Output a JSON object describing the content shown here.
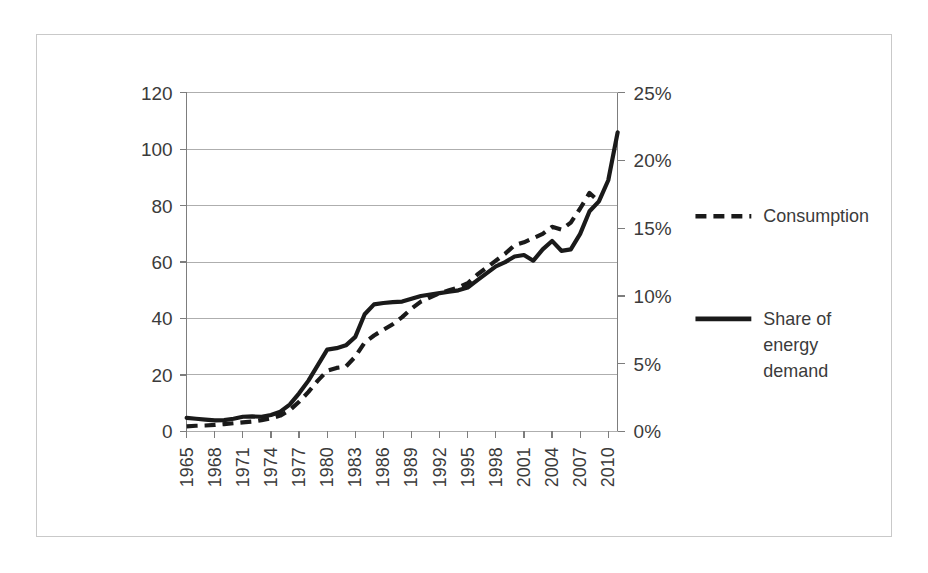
{
  "chart_data": {
    "type": "line",
    "title": "",
    "subtitle": "",
    "xlabel": "",
    "ylabel": "",
    "y2label": "",
    "grid": true,
    "legend_position": "right",
    "x": [
      1965,
      1966,
      1967,
      1968,
      1969,
      1970,
      1971,
      1972,
      1973,
      1974,
      1975,
      1976,
      1977,
      1978,
      1979,
      1980,
      1981,
      1982,
      1983,
      1984,
      1985,
      1986,
      1987,
      1988,
      1989,
      1990,
      1991,
      1992,
      1993,
      1994,
      1995,
      1996,
      1997,
      1998,
      1999,
      2000,
      2001,
      2002,
      2003,
      2004,
      2005,
      2006,
      2007,
      2008,
      2009,
      2010,
      2011
    ],
    "xtick_labels": [
      "1965",
      "1968",
      "1971",
      "1974",
      "1977",
      "1980",
      "1983",
      "1986",
      "1989",
      "1992",
      "1995",
      "1998",
      "2001",
      "2004",
      "2007",
      "2010"
    ],
    "xtick_step": 3,
    "ytick_labels_left": [
      "0",
      "20",
      "40",
      "60",
      "80",
      "100",
      "120"
    ],
    "ytick_labels_right": [
      "0%",
      "5%",
      "10%",
      "15%",
      "20%",
      "25%"
    ],
    "ylim": [
      0,
      120
    ],
    "y2lim": [
      0,
      25
    ],
    "axis_left_label_format": "number",
    "axis_right_label_format": "percent",
    "series": [
      {
        "name": "Consumption",
        "style": "dashed",
        "axis": "left",
        "color": "#1a1a1a",
        "values": [
          1.8,
          2.0,
          2.1,
          2.3,
          2.6,
          2.9,
          3.2,
          3.5,
          4.0,
          4.6,
          5.6,
          7.5,
          10.5,
          14.0,
          18.0,
          21.5,
          22.5,
          23.0,
          26.5,
          31.5,
          34.0,
          36.0,
          38.0,
          40.5,
          43.5,
          46.0,
          47.5,
          49.0,
          50.0,
          51.0,
          52.5,
          55.5,
          58.0,
          60.5,
          63.0,
          66.0,
          67.0,
          68.5,
          70.0,
          72.5,
          71.5,
          74.0,
          79.0,
          84.5,
          81.5,
          null,
          null
        ]
      },
      {
        "name": "Share of energy demand",
        "style": "solid",
        "axis": "right",
        "color": "#1a1a1a",
        "values": [
          4.8,
          4.5,
          4.2,
          3.9,
          4.0,
          4.5,
          5.2,
          5.3,
          5.2,
          5.8,
          7.0,
          9.5,
          13.5,
          18.0,
          23.5,
          29.0,
          29.5,
          30.5,
          33.5,
          41.5,
          45.0,
          45.5,
          45.8,
          46.0,
          47.0,
          48.0,
          48.5,
          49.0,
          49.5,
          50.0,
          51.0,
          53.5,
          56.0,
          58.5,
          60.0,
          62.0,
          62.5,
          60.5,
          64.5,
          67.5,
          64.0,
          64.5,
          70.0,
          78.0,
          81.5,
          89.0,
          106.0
        ],
        "values_percent": [
          1.0,
          0.94,
          0.88,
          0.81,
          0.83,
          0.94,
          1.08,
          1.1,
          1.08,
          1.21,
          1.46,
          1.98,
          2.81,
          3.75,
          4.9,
          6.04,
          6.15,
          6.35,
          6.98,
          8.65,
          9.38,
          9.48,
          9.54,
          9.58,
          9.79,
          10.0,
          10.1,
          10.2,
          10.3,
          10.4,
          10.6,
          11.1,
          11.7,
          12.2,
          12.5,
          12.9,
          13.0,
          12.6,
          13.4,
          14.1,
          13.3,
          13.4,
          14.6,
          16.3,
          17.0,
          18.5,
          22.1
        ]
      }
    ],
    "legend": [
      {
        "label": "Consumption",
        "style": "dashed"
      },
      {
        "label": "Share of energy demand",
        "style": "solid",
        "label_lines": [
          "Share of",
          "energy",
          "demand"
        ]
      }
    ],
    "colors": {
      "series": "#1a1a1a",
      "gridline": "#aeaeae",
      "axis": "#7d7d7d",
      "frame": "#c9c9c9",
      "text": "#3b3b3b",
      "background": "#ffffff"
    }
  }
}
